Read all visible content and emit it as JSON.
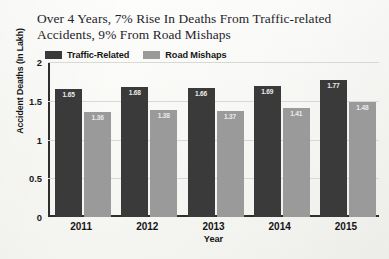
{
  "chart_data": {
    "type": "bar",
    "title": "Over 4 Years, 7% Rise In Deaths From Traffic-related Accidents, 9% From Road Mishaps",
    "title_lines": [
      "Over 4 Years, 7% Rise In Deaths From Traffic-related",
      "Accidents, 9% From Road Mishaps"
    ],
    "xlabel": "Year",
    "ylabel": "Accident Deaths (In Lakh)",
    "categories": [
      "2011",
      "2012",
      "2013",
      "2014",
      "2015"
    ],
    "series": [
      {
        "name": "Traffic-Related",
        "color": "#3a3a3a",
        "values": [
          1.65,
          1.68,
          1.66,
          1.69,
          1.77
        ],
        "labels": [
          "1.65",
          "1.68",
          "1.66",
          "1.69",
          "1.77"
        ]
      },
      {
        "name": "Road Mishaps",
        "color": "#9a9a9a",
        "values": [
          1.36,
          1.38,
          1.37,
          1.41,
          1.48
        ],
        "labels": [
          "1.36",
          "1.38",
          "1.37",
          "1.41",
          "1.48"
        ]
      }
    ],
    "ylim": [
      0,
      2
    ],
    "yticks": [
      "0",
      "0.5",
      "1",
      "1.5",
      "2"
    ],
    "ytick_values": [
      0,
      0.5,
      1,
      1.5,
      2
    ],
    "grid": true,
    "legend_position": "top-left"
  },
  "colors": {
    "background": "#f7f7f5",
    "axis": "#2e2e2e",
    "grid": "#d8d8d4",
    "series_dark": "#3a3a3a",
    "series_light": "#9a9a9a",
    "value_label": "#ebebe8"
  }
}
